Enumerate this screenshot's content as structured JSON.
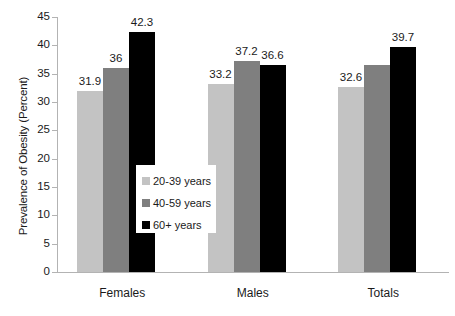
{
  "chart_data": {
    "type": "bar",
    "title": "",
    "xlabel": "",
    "ylabel": "Prevalence of Obesity (Percent)",
    "categories": [
      "Females",
      "Males",
      "Totals"
    ],
    "series": [
      {
        "name": "20-39 years",
        "color": "#c3c3c3",
        "values": [
          31.9,
          33.2,
          32.6
        ],
        "labels": [
          "31.9",
          "33.2",
          "32.6"
        ]
      },
      {
        "name": "40-59 years",
        "color": "#7f7f7f",
        "values": [
          36,
          37.2,
          36.6
        ],
        "labels": [
          "36",
          "37.2",
          ""
        ]
      },
      {
        "name": "60+ years",
        "color": "#000000",
        "values": [
          42.3,
          36.6,
          39.7
        ],
        "labels": [
          "42.3",
          "36.6",
          "39.7"
        ]
      }
    ],
    "ylim": [
      0,
      45
    ],
    "yticks": [
      0,
      5,
      10,
      15,
      20,
      25,
      30,
      35,
      40,
      45
    ],
    "ytick_labels": [
      "0",
      "5",
      "10",
      "15",
      "20",
      "25",
      "30",
      "35",
      "40",
      "45"
    ],
    "grid": false,
    "legend_position": "center-inside"
  },
  "legend": {
    "items": [
      {
        "label": "20-39 years",
        "color": "#c3c3c3"
      },
      {
        "label": "40-59 years",
        "color": "#7f7f7f"
      },
      {
        "label": "60+ years",
        "color": "#000000"
      }
    ]
  },
  "axes": {
    "y_title": "Prevalence of Obesity (Percent)",
    "y_labels": [
      "45",
      "40",
      "35",
      "30",
      "25",
      "20",
      "15",
      "10",
      "5",
      "0"
    ],
    "x_labels": [
      "Females",
      "Males",
      "Totals"
    ]
  }
}
